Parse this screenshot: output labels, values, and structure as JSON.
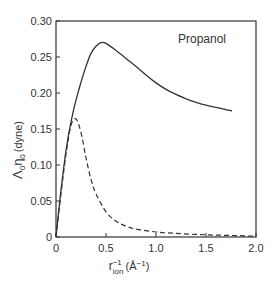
{
  "chart_data": {
    "type": "line",
    "title": "",
    "annotation": "Propanol",
    "xlabel": "r_ion^-1 (Å^-1)",
    "ylabel": "Λ0η0 (dyne)",
    "xlim": [
      0,
      2.0
    ],
    "ylim": [
      0,
      0.3
    ],
    "grid": false,
    "legend": "none",
    "x_ticks": [
      "0",
      "0.5",
      "1.0",
      "1.5",
      "2.0"
    ],
    "y_ticks": [
      "0",
      "0.05",
      "0.10",
      "0.15",
      "0.20",
      "0.25",
      "0.30"
    ],
    "series": [
      {
        "name": "solid",
        "style": "solid",
        "x": [
          0,
          0.05,
          0.1,
          0.15,
          0.2,
          0.25,
          0.3,
          0.35,
          0.4,
          0.45,
          0.5,
          0.6,
          0.7,
          0.8,
          0.9,
          1.0,
          1.1,
          1.2,
          1.3,
          1.4,
          1.5,
          1.6,
          1.7,
          1.76
        ],
        "y": [
          0,
          0.065,
          0.12,
          0.16,
          0.19,
          0.215,
          0.237,
          0.255,
          0.265,
          0.27,
          0.269,
          0.259,
          0.248,
          0.237,
          0.225,
          0.214,
          0.205,
          0.198,
          0.192,
          0.187,
          0.183,
          0.18,
          0.177,
          0.175
        ]
      },
      {
        "name": "dashed",
        "style": "dashed",
        "x": [
          0,
          0.05,
          0.1,
          0.15,
          0.2,
          0.25,
          0.3,
          0.35,
          0.4,
          0.5,
          0.6,
          0.7,
          0.8,
          1.0,
          1.2,
          1.5,
          1.8,
          2.0
        ],
        "y": [
          0,
          0.06,
          0.115,
          0.155,
          0.164,
          0.145,
          0.11,
          0.08,
          0.06,
          0.035,
          0.022,
          0.015,
          0.011,
          0.007,
          0.005,
          0.003,
          0.002,
          0.001
        ]
      }
    ]
  },
  "labels": {
    "annotation": "Propanol",
    "ylabel_main": "Λ",
    "ylabel_sub1": "0",
    "ylabel_eta": "η",
    "ylabel_sub2": "0",
    "ylabel_unit": "(dyne)",
    "xlabel_r": "r",
    "xlabel_sup": "−1",
    "xlabel_sub": "ion",
    "xlabel_unit_open": "(Å",
    "xlabel_unit_sup": "−1",
    "xlabel_unit_close": ")"
  }
}
